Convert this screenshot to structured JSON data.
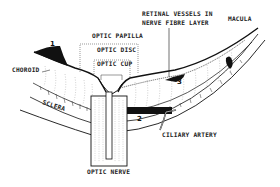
{
  "diagram": {
    "type": "anatomical-cross-section",
    "labels": {
      "optic_papilla": "OPTIC PAPILLA",
      "optic_disc": "OPTIC DISC",
      "optic_cup": "OPTIC CUP",
      "retinal_vessels_line1": "RETINAL VESSELS IN",
      "retinal_vessels_line2": "NERVE FIBRE LAYER",
      "macula": "MACULA",
      "choroid": "CHOROID",
      "sclera": "SCLERA",
      "ciliary_artery": "CILIARY ARTERY",
      "optic_nerve": "OPTIC NERVE"
    },
    "markers": {
      "m1": "1",
      "m2": "2",
      "m3": "3"
    },
    "colors": {
      "ink": "#111111",
      "background": "#ffffff",
      "hatch": "#555555"
    }
  }
}
